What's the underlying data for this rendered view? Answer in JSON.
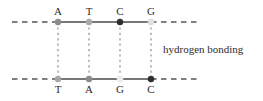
{
  "diagram": {
    "annotation_label": "hydrogen bonding",
    "colors": {
      "strand_line": "#4a4a4a",
      "strand_dash": "#555555",
      "hbond_dash": "#9a9a9a",
      "text": "#2b2b2b",
      "background": "#ffffff"
    },
    "geometry": {
      "top_strand_y": 22,
      "bottom_strand_y": 79,
      "strand_left_dash_start": 12,
      "strand_left_solid_start": 58,
      "strand_right_solid_end": 151,
      "strand_right_dash_end": 200,
      "site_x": [
        58,
        89,
        120,
        151
      ]
    },
    "top_strand": {
      "name": "top-strand",
      "bases": [
        {
          "letter": "A",
          "x": 58,
          "dot_color": "#8c8c8c"
        },
        {
          "letter": "T",
          "x": 89,
          "dot_color": "#aaaaaa"
        },
        {
          "letter": "C",
          "x": 120,
          "dot_color": "#2e2e2e"
        },
        {
          "letter": "G",
          "x": 151,
          "dot_color": "#e0e0e0"
        }
      ]
    },
    "bottom_strand": {
      "name": "bottom-strand",
      "bases": [
        {
          "letter": "T",
          "x": 58,
          "dot_color": "#a6a6a6"
        },
        {
          "letter": "A",
          "x": 89,
          "dot_color": "#8c8c8c"
        },
        {
          "letter": "G",
          "x": 120,
          "dot_color": "#ededed"
        },
        {
          "letter": "C",
          "x": 151,
          "dot_color": "#2e2e2e"
        }
      ]
    },
    "hydrogen_bonds": [
      {
        "x": 58,
        "from_y": 22,
        "to_y": 79
      },
      {
        "x": 89,
        "from_y": 22,
        "to_y": 79
      },
      {
        "x": 120,
        "from_y": 22,
        "to_y": 79
      },
      {
        "x": 151,
        "from_y": 22,
        "to_y": 79
      }
    ]
  }
}
